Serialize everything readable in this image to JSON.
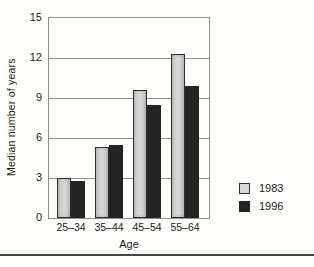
{
  "chart_data": {
    "type": "bar",
    "title": "",
    "categories": [
      "25–34",
      "35–44",
      "45–54",
      "55–64"
    ],
    "series": [
      {
        "name": "1983",
        "values": [
          3.0,
          5.3,
          9.6,
          12.3
        ],
        "color": "#d7d7d7",
        "border_color": "#2e2e2e"
      },
      {
        "name": "1996",
        "values": [
          2.8,
          5.5,
          8.5,
          9.9
        ],
        "color": "#242424",
        "border_color": "#242424"
      }
    ],
    "xlabel": "Age",
    "ylabel": "Median number of years",
    "ylim": [
      0,
      15
    ],
    "yticks": [
      0,
      3,
      6,
      9,
      12,
      15
    ],
    "grid": true,
    "gridline_color": "#8f8f8f",
    "plot_border_color": "#8f8f8f",
    "legend_position": "right-bottom",
    "background_color": "#fdfdfa",
    "bottom_rule_color": "#454545"
  }
}
